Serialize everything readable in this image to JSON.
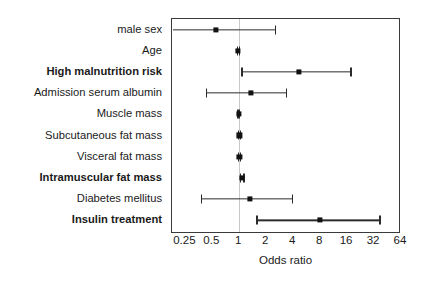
{
  "chart_data": {
    "type": "scatter",
    "subtype": "forest-plot",
    "title": "",
    "xlabel": "Odds ratio",
    "ylabel": "",
    "xscale": "log2",
    "xlim": [
      0.177,
      64
    ],
    "grid": false,
    "reference_line": 1,
    "legend": null,
    "xticks": [
      {
        "value": 0.25,
        "label": "0.25"
      },
      {
        "value": 0.5,
        "label": "0.5"
      },
      {
        "value": 1,
        "label": "1"
      },
      {
        "value": 2,
        "label": "2"
      },
      {
        "value": 4,
        "label": "4"
      },
      {
        "value": 8,
        "label": "8"
      },
      {
        "value": 16,
        "label": "16"
      },
      {
        "value": 32,
        "label": "32"
      },
      {
        "value": 64,
        "label": "64"
      }
    ],
    "categories": [
      "male sex",
      "Age",
      "High malnutrition risk",
      "Admission serum albumin",
      "Muscle mass",
      "Subcutaneous fat mass",
      "Visceral fat mass",
      "Intramuscular fat mass",
      "Diabetes mellitus",
      "Insulin treatment"
    ],
    "rows": [
      {
        "label": "male sex",
        "bold": false,
        "or": 0.55,
        "ci_low": 0.18,
        "ci_high": 2.6,
        "ci_low_clipped": true
      },
      {
        "label": "Age",
        "bold": false,
        "or": 0.97,
        "ci_low": 0.93,
        "ci_high": 1.02,
        "ci_low_clipped": false
      },
      {
        "label": "High malnutrition risk",
        "bold": true,
        "or": 4.6,
        "ci_low": 1.05,
        "ci_high": 18.0,
        "ci_low_clipped": false
      },
      {
        "label": "Admission serum albumin",
        "bold": false,
        "or": 1.35,
        "ci_low": 0.42,
        "ci_high": 3.4,
        "ci_low_clipped": false
      },
      {
        "label": "Muscle mass",
        "bold": false,
        "or": 0.99,
        "ci_low": 0.95,
        "ci_high": 1.03,
        "ci_low_clipped": false
      },
      {
        "label": "Subcutaneous fat mass",
        "bold": false,
        "or": 1.0,
        "ci_low": 0.97,
        "ci_high": 1.04,
        "ci_low_clipped": false
      },
      {
        "label": "Visceral fat mass",
        "bold": false,
        "or": 1.0,
        "ci_low": 0.97,
        "ci_high": 1.04,
        "ci_low_clipped": false
      },
      {
        "label": "Intramuscular fat mass",
        "bold": true,
        "or": 1.08,
        "ci_low": 1.02,
        "ci_high": 1.15,
        "ci_low_clipped": false
      },
      {
        "label": "Diabetes mellitus",
        "bold": false,
        "or": 1.3,
        "ci_low": 0.37,
        "ci_high": 4.0,
        "ci_low_clipped": false
      },
      {
        "label": "Insulin treatment",
        "bold": true,
        "or": 8.0,
        "ci_low": 1.55,
        "ci_high": 38.0,
        "ci_low_clipped": false
      }
    ]
  },
  "axis": {
    "x_title": "Odds ratio"
  },
  "colors": {
    "point": "#111111",
    "ci": "#2b2b2b",
    "frame": "#3a3a3a",
    "refline": "#c9c9c9",
    "background": "#ffffff",
    "text": "#1a1a1a"
  }
}
